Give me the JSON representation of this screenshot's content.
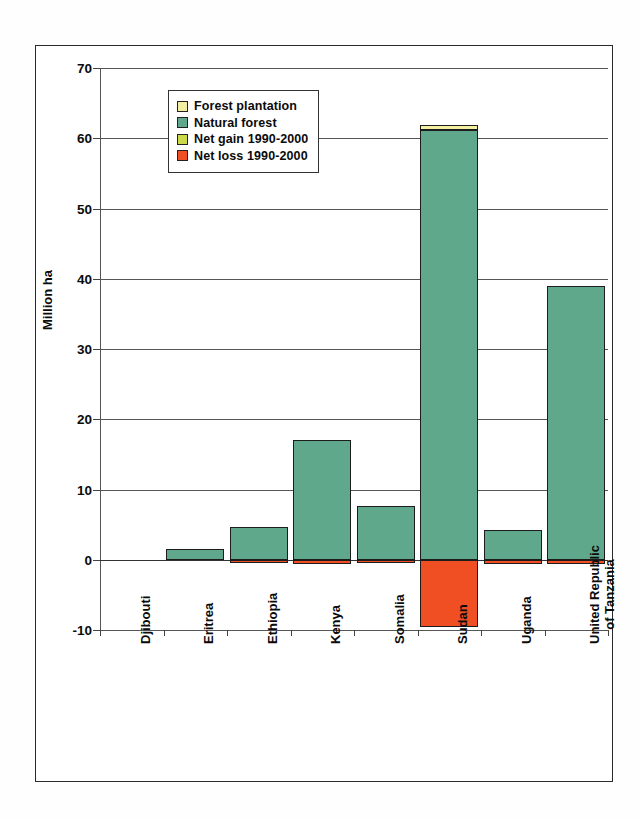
{
  "chart_data": {
    "type": "bar",
    "title": "",
    "subtitle": "",
    "xlabel": "",
    "ylabel": "Million ha",
    "ylim": [
      -10,
      70
    ],
    "yticks": [
      -10,
      0,
      10,
      20,
      30,
      40,
      50,
      60,
      70
    ],
    "ytick_labels": [
      "-10",
      "0",
      "10",
      "20",
      "30",
      "40",
      "50",
      "60",
      "70"
    ],
    "grid": true,
    "stacked": true,
    "legend_position": "upper-left-inside",
    "categories": [
      "Djibouti",
      "Eritrea",
      "Ethiopia",
      "Kenya",
      "Somalia",
      "Sudan",
      "Uganda",
      "United Republic of Tanzania"
    ],
    "category_lines": [
      [
        "Djibouti"
      ],
      [
        "Eritrea"
      ],
      [
        "Ethiopia"
      ],
      [
        "Kenya"
      ],
      [
        "Somalia"
      ],
      [
        "Sudan"
      ],
      [
        "Uganda"
      ],
      [
        "United Republic",
        "of Tanzania"
      ]
    ],
    "series": [
      {
        "name": "Forest plantation",
        "color": "#F2F0A0",
        "values": [
          0.0,
          0.0,
          0.0,
          0.0,
          0.0,
          0.7,
          0.0,
          0.0
        ]
      },
      {
        "name": "Natural forest",
        "color": "#5FA88C",
        "values": [
          0.0,
          1.6,
          4.6,
          17.1,
          7.7,
          61.2,
          4.2,
          38.9
        ]
      },
      {
        "name": "Net gain 1990-2000",
        "color": "#CBD84A",
        "values": [
          0.0,
          0.0,
          0.0,
          0.0,
          0.0,
          0.0,
          0.0,
          0.0
        ]
      },
      {
        "name": "Net loss 1990-2000",
        "color": "#F04E23",
        "values": [
          0.0,
          0.0,
          -0.4,
          -0.6,
          -0.5,
          -9.6,
          -0.6,
          -0.6
        ]
      }
    ]
  },
  "legend": {
    "items": [
      {
        "label": "Forest plantation",
        "color": "#F2F0A0",
        "icon": "legend-swatch-icon"
      },
      {
        "label": "Natural forest",
        "color": "#5FA88C",
        "icon": "legend-swatch-icon"
      },
      {
        "label": "Net gain 1990-2000",
        "color": "#CBD84A",
        "icon": "legend-swatch-icon"
      },
      {
        "label": "Net loss 1990-2000",
        "color": "#F04E23",
        "icon": "legend-swatch-icon"
      }
    ]
  },
  "colors": {
    "natural_forest": "#5FA88C",
    "forest_plantation": "#F2F0A0",
    "net_gain": "#CBD84A",
    "net_loss": "#F04E23",
    "axis": "#333333",
    "background": "#FFFFFF"
  }
}
